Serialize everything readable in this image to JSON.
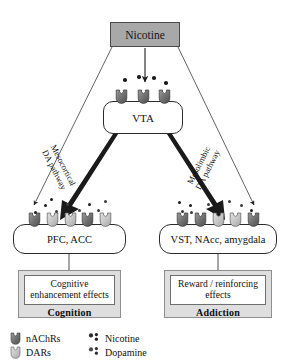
{
  "diagram": {
    "source_node": {
      "label": "Nicotine"
    },
    "vta": {
      "label": "VTA"
    },
    "pathways": [
      {
        "id": "mesocortical",
        "line1": "Mesocortical",
        "line2": "DA pathway"
      },
      {
        "id": "mesolimbic",
        "line1": "Mesolimbic",
        "line2": "DA pathway"
      }
    ],
    "target_regions": [
      {
        "id": "cortical",
        "label": "PFC, ACC"
      },
      {
        "id": "limbic",
        "label": "VST, NAcc, amygdala"
      }
    ],
    "outcomes": [
      {
        "id": "cognition",
        "effect_line1": "Cognitive",
        "effect_line2": "enhancement effects",
        "caption": "Cognition"
      },
      {
        "id": "addiction",
        "effect_line1": "Reward / reinforcing",
        "effect_line2": "effects",
        "caption": "Addiction"
      }
    ]
  },
  "legend": {
    "items": [
      {
        "icon": "receptor-dark-icon",
        "label": "nAChRs"
      },
      {
        "icon": "dots-dark-icon",
        "label": "Nicotine"
      },
      {
        "icon": "receptor-light-icon",
        "label": "DARs"
      },
      {
        "icon": "dots-gray-icon",
        "label": "Dopamine"
      }
    ]
  },
  "colors": {
    "nicotine_box_fill": "#a8a8a8",
    "nicotine_box_border": "#4a4a4a",
    "outcome_box_fill": "#dedede",
    "outcome_inner_fill": "#ffffff",
    "receptor_dark": "#6e6e6e",
    "receptor_light": "#c4c4c4",
    "nicotine_dot": "#1c1c1c",
    "dopamine_dot": "#3c3c3c",
    "stroke": "#2b2b2b"
  }
}
